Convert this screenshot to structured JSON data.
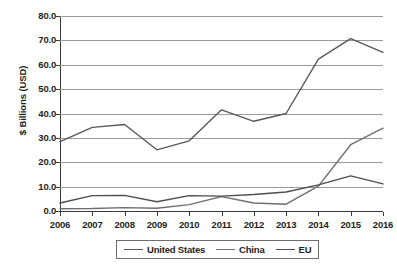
{
  "chart_data": {
    "type": "line",
    "title": "",
    "xlabel": "",
    "ylabel": "$ Billions (USD)",
    "x": [
      2006,
      2007,
      2008,
      2009,
      2010,
      2011,
      2012,
      2013,
      2014,
      2015,
      2016
    ],
    "xtick_labels": [
      "2006",
      "2007",
      "2008",
      "2009",
      "2010",
      "2011",
      "2012",
      "2013",
      "2014",
      "2015",
      "2016"
    ],
    "ylim": [
      0.0,
      80.0
    ],
    "yticks": [
      0.0,
      10.0,
      20.0,
      30.0,
      40.0,
      50.0,
      60.0,
      70.0,
      80.0
    ],
    "ytick_labels": [
      "0.0",
      "10.0",
      "20.0",
      "30.0",
      "40.0",
      "50.0",
      "60.0",
      "70.0",
      "80.0"
    ],
    "grid": true,
    "legend_position": "bottom",
    "series": [
      {
        "name": "United States",
        "color": "#595959",
        "values": [
          28.5,
          34.3,
          35.5,
          25.1,
          28.8,
          41.5,
          36.8,
          40.0,
          62.3,
          70.7,
          65.1
        ]
      },
      {
        "name": "China",
        "color": "#6e6e6e",
        "values": [
          0.9,
          1.0,
          1.4,
          1.1,
          2.6,
          5.9,
          3.3,
          2.8,
          10.2,
          27.2,
          34.0
        ]
      },
      {
        "name": "EU",
        "color": "#4d4d4d",
        "values": [
          3.3,
          6.3,
          6.4,
          3.8,
          6.3,
          6.1,
          6.8,
          7.8,
          10.7,
          14.4,
          11.1
        ]
      }
    ]
  },
  "axes": {
    "y_title": "$ Billions (USD)"
  },
  "legend": {
    "entries": [
      {
        "label": "United States"
      },
      {
        "label": "China"
      },
      {
        "label": "EU"
      }
    ]
  }
}
